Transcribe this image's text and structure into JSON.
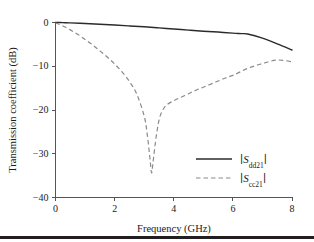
{
  "chart_data": {
    "type": "line",
    "title": "",
    "xlabel": "Frequency (GHz)",
    "ylabel": "Transmission coefficient (dB)",
    "xlim": [
      0,
      8
    ],
    "ylim": [
      -40,
      0
    ],
    "xticks": [
      0,
      2,
      4,
      6,
      8
    ],
    "yticks": [
      0,
      -10,
      -20,
      -30,
      -40
    ],
    "xtick_labels": [
      "0",
      "2",
      "4",
      "6",
      "8"
    ],
    "ytick_labels": [
      "0",
      "-10",
      "-20",
      "-30",
      "-40"
    ],
    "grid": false,
    "legend_position": "lower right",
    "series": [
      {
        "name": "|Sdd21|",
        "label_base": "S",
        "label_sub": "dd21",
        "style": "solid",
        "color": "#2b2b2b",
        "x": [
          0.0,
          0.25,
          0.5,
          1.0,
          1.5,
          2.0,
          2.5,
          3.0,
          3.5,
          4.0,
          4.5,
          5.0,
          5.5,
          6.0,
          6.3,
          6.5,
          7.0,
          7.5,
          8.0
        ],
        "y": [
          -0.1,
          -0.15,
          -0.2,
          -0.35,
          -0.5,
          -0.7,
          -0.9,
          -1.1,
          -1.35,
          -1.6,
          -1.85,
          -2.1,
          -2.3,
          -2.55,
          -2.65,
          -2.75,
          -3.7,
          -5.0,
          -6.4
        ]
      },
      {
        "name": "|Scc21|",
        "label_base": "S",
        "label_sub": "cc21",
        "style": "dashed",
        "color": "#8a8a8a",
        "x": [
          0.0,
          0.25,
          0.5,
          0.75,
          1.0,
          1.25,
          1.5,
          1.75,
          2.0,
          2.25,
          2.5,
          2.75,
          3.0,
          3.1,
          3.2,
          3.25,
          3.3,
          3.4,
          3.5,
          3.6,
          3.75,
          4.0,
          4.25,
          4.5,
          4.75,
          5.0,
          5.25,
          5.5,
          5.75,
          6.0,
          6.25,
          6.5,
          6.75,
          7.0,
          7.25,
          7.5,
          7.75,
          8.0
        ],
        "y": [
          -0.2,
          -0.9,
          -1.8,
          -2.8,
          -4.0,
          -5.2,
          -6.6,
          -8.0,
          -9.6,
          -11.4,
          -13.6,
          -16.5,
          -21.5,
          -25.5,
          -31.5,
          -34.5,
          -32.0,
          -26.5,
          -22.5,
          -20.5,
          -19.0,
          -18.0,
          -17.2,
          -16.4,
          -15.6,
          -14.9,
          -14.2,
          -13.5,
          -12.8,
          -12.2,
          -11.4,
          -10.6,
          -10.0,
          -9.5,
          -9.0,
          -8.7,
          -8.8,
          -9.1
        ]
      }
    ]
  },
  "legend": {
    "items": [
      {
        "base": "S",
        "sub": "dd21",
        "style": "solid"
      },
      {
        "base": "S",
        "sub": "cc21",
        "style": "dashed"
      }
    ]
  }
}
